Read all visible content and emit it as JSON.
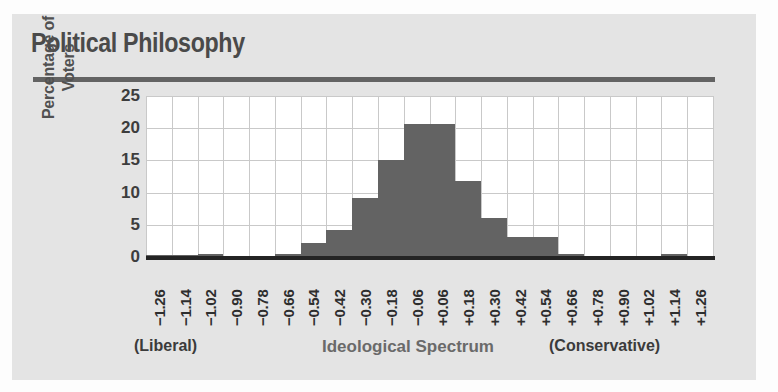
{
  "figure": {
    "title": "Political Philosophy",
    "background_color": "#e4e4e4",
    "bar_color": "#636363",
    "rule_color": "#636363"
  },
  "axes": {
    "ylabel_line1": "Percentage of",
    "ylabel_line2": "Voters",
    "y_ticks": [
      "25",
      "20",
      "15",
      "10",
      "5",
      "0"
    ],
    "xlabel_center": "Ideological Spectrum",
    "xlabel_left": "(Liberal)",
    "xlabel_right": "(Conservative)"
  },
  "chart_data": {
    "type": "bar",
    "title": "Political Philosophy",
    "xlabel": "Ideological Spectrum",
    "ylabel": "Percentage of Voters",
    "ylim": [
      0,
      25
    ],
    "yticks": [
      0,
      5,
      10,
      15,
      20,
      25
    ],
    "grid": true,
    "legend": null,
    "xlabel_left_annotation": "(Liberal)",
    "xlabel_right_annotation": "(Conservative)",
    "categories": [
      "−1.26",
      "−1.14",
      "−1.02",
      "−0.90",
      "−0.78",
      "−0.66",
      "−0.54",
      "−0.42",
      "−0.30",
      "−0.18",
      "−0.06",
      "+0.06",
      "+0.18",
      "+0.30",
      "+0.42",
      "+0.54",
      "+0.66",
      "+0.78",
      "+0.90",
      "+1.02",
      "+1.14",
      "+1.26"
    ],
    "values": [
      0.3,
      0.3,
      0.4,
      0.2,
      0.2,
      0.5,
      2.1,
      4.2,
      9.2,
      15.1,
      20.7,
      20.7,
      11.8,
      6.1,
      3.1,
      3.1,
      0.4,
      0.2,
      0.2,
      0.2,
      0.4,
      0.2
    ]
  }
}
